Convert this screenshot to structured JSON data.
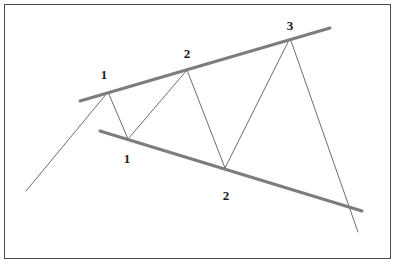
{
  "figure": {
    "kind": "technical-analysis-pattern-diagram",
    "pattern_name": "Broadening Formation",
    "width": 395,
    "height": 263,
    "background_color": "#ffffff",
    "border_color": "#4a4a4a",
    "border_width": 1
  },
  "colors": {
    "price_line": "#6e6e72",
    "trendline": "#7d7d7d",
    "label_text": "#1a1a1a",
    "frame": "#4a4a4a"
  },
  "labels": [
    {
      "id": "peak-1",
      "text": "1",
      "x": 104,
      "y": 75
    },
    {
      "id": "peak-2",
      "text": "2",
      "x": 187,
      "y": 54
    },
    {
      "id": "peak-3",
      "text": "3",
      "x": 290,
      "y": 26
    },
    {
      "id": "trough-1",
      "text": "1",
      "x": 127,
      "y": 159
    },
    {
      "id": "trough-2",
      "text": "2",
      "x": 226,
      "y": 196
    }
  ],
  "chart_data": {
    "type": "line",
    "xlabel": "",
    "ylabel": "",
    "xlim": [
      0,
      395
    ],
    "ylim": [
      263,
      0
    ],
    "grid": false,
    "legend": "none",
    "series": [
      {
        "name": "price-line",
        "kind": "zigzag-price-path",
        "color": "#6e6e72",
        "width": 1,
        "points": [
          [
            26,
            191
          ],
          [
            108,
            92
          ],
          [
            128,
            139
          ],
          [
            187,
            70
          ],
          [
            225,
            168
          ],
          [
            290,
            38
          ],
          [
            358,
            232
          ]
        ],
        "point_roles": [
          "start",
          "peak-1",
          "trough-1",
          "peak-2",
          "trough-2",
          "peak-3",
          "breakdown-end"
        ]
      }
    ],
    "annotations": [
      {
        "name": "upper-trendline",
        "kind": "resistance-trendline",
        "color": "#7d7d7d",
        "width": 3,
        "x1": 80,
        "y1": 101,
        "x2": 330,
        "y2": 28,
        "touches": [
          "peak-1",
          "peak-2",
          "peak-3"
        ]
      },
      {
        "name": "lower-trendline",
        "kind": "support-trendline",
        "color": "#7d7d7d",
        "width": 3,
        "x1": 100,
        "y1": 131,
        "x2": 362,
        "y2": 211,
        "touches": [
          "trough-1",
          "trough-2"
        ]
      }
    ]
  }
}
